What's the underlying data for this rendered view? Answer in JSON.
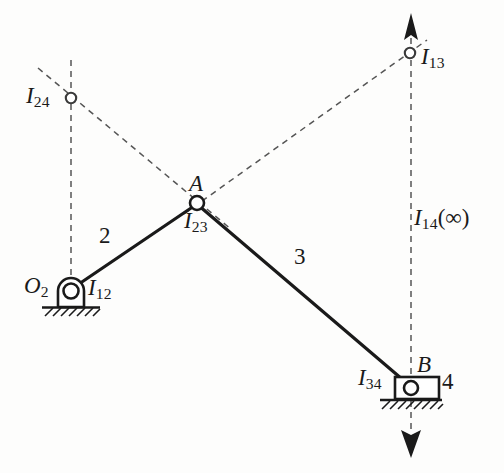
{
  "figure": {
    "type": "kinematic-linkage-instant-center-diagram",
    "background_color": "#fdfdfc",
    "ink_color": "#1a1a1a",
    "dash_color": "#555555"
  },
  "joints": {
    "O2": {
      "label": "O",
      "sub": "2",
      "x": 71,
      "y": 291,
      "label_x": 26,
      "label_y": 279
    },
    "A": {
      "label": "A",
      "sub": "",
      "x": 197,
      "y": 203,
      "label_x": 189,
      "label_y": 176
    },
    "B": {
      "label": "B",
      "sub": "",
      "x": 411,
      "y": 388,
      "label_x": 418,
      "label_y": 358
    }
  },
  "instant_centers": [
    {
      "name": "I24",
      "label": "I",
      "sub": "24",
      "x": 71,
      "y": 98,
      "label_x": 26,
      "label_y": 91
    },
    {
      "name": "I13",
      "label": "I",
      "sub": "13",
      "x": 410,
      "y": 53,
      "label_x": 421,
      "label_y": 52
    },
    {
      "name": "I12",
      "label": "I",
      "sub": "12",
      "x": 71,
      "y": 291,
      "label_x": 88,
      "label_y": 281
    },
    {
      "name": "I23",
      "label": "I",
      "sub": "23",
      "x": 197,
      "y": 203,
      "label_x": 185,
      "label_y": 214
    },
    {
      "name": "I34",
      "label": "I",
      "sub": "34",
      "x": 411,
      "y": 388,
      "label_x": 359,
      "label_y": 371
    },
    {
      "name": "I14",
      "label": "I",
      "sub": "14",
      "paren": "(∞)",
      "x": 411,
      "y": 220,
      "label_x": 414,
      "label_y": 208
    }
  ],
  "links": [
    {
      "name": "link-2",
      "number": "2",
      "from": "O2",
      "to": "A",
      "label_x": 100,
      "label_y": 228
    },
    {
      "name": "link-3",
      "number": "3",
      "from": "A",
      "to": "B",
      "label_x": 295,
      "label_y": 249
    },
    {
      "name": "link-4",
      "number": "4",
      "from": "B",
      "to": "B",
      "label_x": 437,
      "label_y": 374
    }
  ],
  "construction_lines": [
    {
      "name": "vertical-through-O2-I24",
      "x1": 71,
      "y1": 60,
      "x2": 71,
      "y2": 291
    },
    {
      "name": "diagonal-I24-to-A",
      "x1": 38,
      "y1": 68,
      "x2": 230,
      "y2": 228
    },
    {
      "name": "diagonal-A-to-I13",
      "x1": 186,
      "y1": 212,
      "x2": 426,
      "y2": 41
    },
    {
      "name": "vertical-I13-to-B",
      "x1": 411,
      "y1": 38,
      "x2": 411,
      "y2": 430
    }
  ],
  "arrows": [
    {
      "name": "arrow-up-I13",
      "direction": "up",
      "x": 411,
      "tip_y": 14,
      "base_y": 40
    },
    {
      "name": "arrow-down-B",
      "direction": "down",
      "x": 411,
      "tip_y": 457,
      "base_y": 430
    }
  ],
  "ground_supports": [
    {
      "name": "ground-pivot-O2",
      "x": 71,
      "y": 307,
      "width": 58,
      "hatch_count": 7
    },
    {
      "name": "ground-slider-4",
      "x": 411,
      "y": 400,
      "width": 62,
      "hatch_count": 8
    }
  ],
  "slider": {
    "name": "slider-block-4",
    "x": 395,
    "y": 377,
    "width": 44,
    "height": 22
  }
}
